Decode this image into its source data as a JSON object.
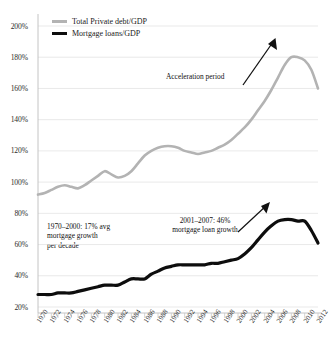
{
  "chart_data": {
    "type": "line",
    "title": "",
    "xlabel": "",
    "ylabel": "",
    "ylim": [
      20,
      200
    ],
    "xlim": [
      1970,
      2012
    ],
    "grid": true,
    "legend_position": "top-left",
    "y_ticks": [
      "20%",
      "40%",
      "60%",
      "80%",
      "100%",
      "120%",
      "140%",
      "160%",
      "180%",
      "200%"
    ],
    "y_tick_values": [
      20,
      40,
      60,
      80,
      100,
      120,
      140,
      160,
      180,
      200
    ],
    "x_ticks": [
      "1970",
      "1972",
      "1974",
      "1976",
      "1978",
      "1980",
      "1982",
      "1984",
      "1986",
      "1988",
      "1990",
      "1992",
      "1994",
      "1996",
      "1998",
      "2000",
      "2002",
      "2004",
      "2006",
      "2008",
      "2010",
      "2012"
    ],
    "x": [
      1970,
      1971,
      1972,
      1973,
      1974,
      1975,
      1976,
      1977,
      1978,
      1979,
      1980,
      1981,
      1982,
      1983,
      1984,
      1985,
      1986,
      1987,
      1988,
      1989,
      1990,
      1991,
      1992,
      1993,
      1994,
      1995,
      1996,
      1997,
      1998,
      1999,
      2000,
      2001,
      2002,
      2003,
      2004,
      2005,
      2006,
      2007,
      2008,
      2009,
      2010,
      2011,
      2012
    ],
    "series": [
      {
        "name": "Total Private debt/GDP",
        "color": "#b3b3b3",
        "values": [
          92,
          93,
          95,
          97,
          98,
          97,
          96,
          98,
          101,
          104,
          107,
          105,
          103,
          104,
          107,
          112,
          117,
          120,
          122,
          123,
          123,
          122,
          120,
          119,
          118,
          119,
          120,
          122,
          124,
          127,
          131,
          135,
          140,
          146,
          152,
          159,
          167,
          175,
          180,
          180,
          178,
          172,
          160
        ]
      },
      {
        "name": "Mortgage loans/GDP",
        "color": "#0d0d0d",
        "values": [
          28,
          28,
          28,
          29,
          29,
          29,
          30,
          31,
          32,
          33,
          34,
          34,
          34,
          36,
          38,
          38,
          38,
          41,
          43,
          45,
          46,
          47,
          47,
          47,
          47,
          47,
          48,
          48,
          49,
          50,
          51,
          54,
          58,
          63,
          68,
          72,
          75,
          76,
          76,
          75,
          75,
          69,
          61
        ]
      }
    ],
    "annotations": [
      {
        "name": "acceleration-period",
        "text": "Acceleration period"
      },
      {
        "name": "early-growth-note",
        "lines": [
          "1970–2000: 17% avg",
          "mortgage growth",
          "per decade"
        ]
      },
      {
        "name": "late-growth-note",
        "lines": [
          "2001–2007: 46%",
          "mortgage loan growth"
        ]
      }
    ]
  }
}
